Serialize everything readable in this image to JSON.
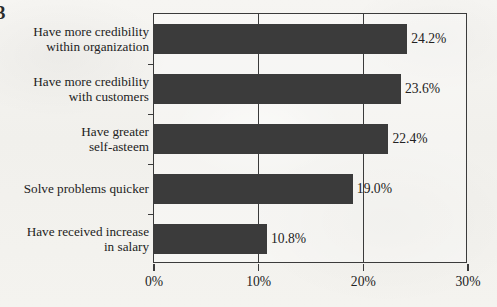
{
  "figure": {
    "label": "3"
  },
  "chart_data": {
    "type": "bar",
    "orientation": "horizontal",
    "title": "",
    "subtitle": "",
    "xlabel": "",
    "ylabel": "",
    "xlim": [
      0,
      30
    ],
    "grid": true,
    "legend": null,
    "categories": [
      "Have more credibility\nwithin organization",
      "Have more credibility\nwith customers",
      "Have greater\nself-asteem",
      "Solve problems quicker",
      "Have received increase\nin salary"
    ],
    "values": [
      24.2,
      23.6,
      22.4,
      19.0,
      10.8
    ],
    "value_labels": [
      "24.2%",
      "23.6%",
      "22.4%",
      "19.0%",
      "10.8%"
    ],
    "xticks": [
      0,
      10,
      20,
      30
    ],
    "xtick_labels": [
      "0%",
      "10%",
      "20%",
      "30%"
    ],
    "colors": {
      "bar": "#3b3b3b",
      "axis": "#3b3b3b",
      "text": "#222222",
      "background": "#f4f3f0"
    }
  }
}
